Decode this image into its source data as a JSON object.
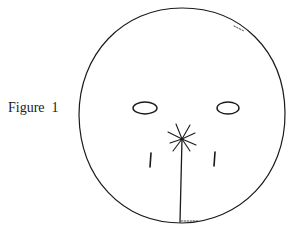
{
  "figure": {
    "caption": "Figure  1",
    "elements": {
      "outline": {
        "shape": "circle",
        "cx": 182,
        "cy": 115,
        "rx": 103,
        "ry": 107
      },
      "left_eye": {
        "shape": "ellipse",
        "cx": 145,
        "cy": 108,
        "rx": 12,
        "ry": 6
      },
      "right_eye": {
        "shape": "ellipse",
        "cx": 228,
        "cy": 108,
        "rx": 11,
        "ry": 6
      },
      "nose_star": {
        "shape": "asterisk",
        "cx": 182,
        "cy": 139,
        "rays": 8
      },
      "center_line": {
        "x1": 182,
        "y1": 139,
        "x2": 180,
        "y2": 222
      },
      "left_mark": {
        "x1": 151,
        "y1": 153,
        "x2": 150,
        "y2": 167
      },
      "right_mark": {
        "x1": 215,
        "y1": 152,
        "x2": 214,
        "y2": 166
      }
    },
    "ink_color": "#1a1a1a"
  }
}
